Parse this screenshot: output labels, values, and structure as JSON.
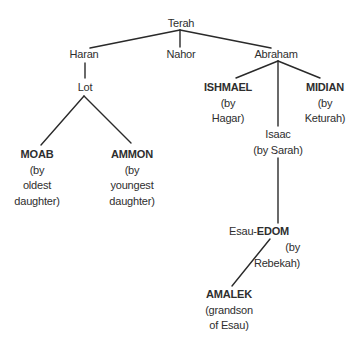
{
  "line_color": "#2a2a2a",
  "text_color": "#2e2e2e",
  "nodes": {
    "terah": {
      "name": "Terah"
    },
    "haran": {
      "name": "Haran"
    },
    "nahor": {
      "name": "Nahor"
    },
    "abraham": {
      "name": "Abraham"
    },
    "lot": {
      "name": "Lot"
    },
    "moab": {
      "name": "MOAB",
      "lines": [
        "(by",
        "oldest",
        "daughter)"
      ]
    },
    "ammon": {
      "name": "AMMON",
      "lines": [
        "(by",
        "youngest",
        "daughter)"
      ]
    },
    "ishmael": {
      "name": "ISHMAEL",
      "lines": [
        "(by",
        "Hagar)"
      ]
    },
    "midian": {
      "name": "MIDIAN",
      "lines": [
        "(by",
        "Keturah)"
      ]
    },
    "isaac": {
      "name": "Isaac",
      "lines": [
        "(by Sarah)"
      ]
    },
    "esau": {
      "prefix": "Esau-",
      "name": "EDOM",
      "lines": [
        "(by",
        "Rebekah)"
      ]
    },
    "amalek": {
      "name": "AMALEK",
      "lines": [
        "(grandson",
        "of Esau)"
      ]
    }
  },
  "edges": [
    [
      "terah",
      "haran"
    ],
    [
      "terah",
      "nahor"
    ],
    [
      "terah",
      "abraham"
    ],
    [
      "haran",
      "lot"
    ],
    [
      "lot",
      "moab"
    ],
    [
      "lot",
      "ammon"
    ],
    [
      "abraham",
      "ishmael"
    ],
    [
      "abraham",
      "isaac"
    ],
    [
      "abraham",
      "midian"
    ],
    [
      "isaac",
      "esau"
    ],
    [
      "esau",
      "amalek"
    ]
  ]
}
